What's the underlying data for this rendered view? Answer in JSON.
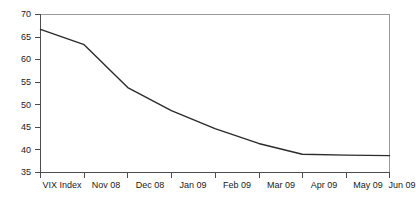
{
  "chart_data": {
    "type": "line",
    "title": "",
    "subtitle": "",
    "xlabel": "",
    "ylabel": "",
    "categories": [
      "VIX Index",
      "Nov 08",
      "Dec 08",
      "Jan 09",
      "Feb 09",
      "Mar 09",
      "Apr 09",
      "May 09",
      "Jun 09"
    ],
    "series": [
      {
        "name": "VIX Index",
        "values": [
          66.7,
          63.3,
          53.8,
          48.7,
          44.7,
          41.4,
          39.0,
          38.8,
          38.7
        ]
      }
    ],
    "ylim": [
      35,
      70
    ],
    "yticks": [
      35,
      40,
      45,
      50,
      55,
      60,
      65,
      70
    ],
    "ytick_labels": [
      "35",
      "40",
      "45",
      "50",
      "55",
      "60",
      "65",
      "70"
    ],
    "xtick_labels": [
      "VIX Index",
      "Nov 08",
      "Dec 08",
      "Jan 09",
      "Feb 09",
      "Mar 09",
      "Apr 09",
      "May 09",
      "Jun 09"
    ],
    "grid": false,
    "legend": false,
    "legend_position": "none",
    "line_color": "#2b2b2b",
    "axis_color": "#4d4d4d",
    "frame_color": "#9a9a9a",
    "background_color": "#ffffff"
  },
  "axes": {
    "y_axis_name": "value-axis",
    "x_axis_name": "category-axis"
  }
}
